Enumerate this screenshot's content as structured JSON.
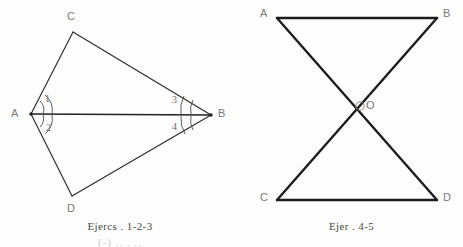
{
  "page": {
    "background_color": "#fdfdfc",
    "width": 463,
    "height": 247
  },
  "figures": [
    {
      "id": "figure-left",
      "name": "quadrilateral-with-diagonal",
      "caption": "Ejercs . 1-2-3",
      "stroke_color": "#2b2b2b",
      "label_color": "#7a7a78",
      "vertices": [
        {
          "label": "A",
          "x": 31,
          "y": 114
        },
        {
          "label": "B",
          "x": 211,
          "y": 115
        },
        {
          "label": "C",
          "x": 73,
          "y": 32
        },
        {
          "label": "D",
          "x": 72,
          "y": 196
        }
      ],
      "vertex_labels": [
        {
          "label": "A",
          "x": 11,
          "y": 108
        },
        {
          "label": "B",
          "x": 218,
          "y": 108
        },
        {
          "label": "C",
          "x": 67,
          "y": 11
        },
        {
          "label": "D",
          "x": 67,
          "y": 203
        }
      ],
      "edges": [
        {
          "from": "A",
          "to": "C"
        },
        {
          "from": "C",
          "to": "B"
        },
        {
          "from": "B",
          "to": "D"
        },
        {
          "from": "D",
          "to": "A"
        },
        {
          "from": "A",
          "to": "B",
          "role": "diagonal"
        }
      ],
      "angles": [
        {
          "number": "1",
          "at": "A",
          "label_x": 45,
          "label_y": 94
        },
        {
          "number": "2",
          "at": "A",
          "label_x": 46,
          "label_y": 123
        },
        {
          "number": "3",
          "at": "B",
          "label_x": 172,
          "label_y": 95
        },
        {
          "number": "4",
          "at": "B",
          "label_x": 172,
          "label_y": 122
        }
      ]
    },
    {
      "id": "figure-right",
      "name": "bowtie-intersecting-triangles",
      "caption": "Ejer . 4-5",
      "stroke_color": "#1c1c1c",
      "label_color": "#7a7a78",
      "vertices": [
        {
          "label": "A",
          "x": 37,
          "y": 18
        },
        {
          "label": "B",
          "x": 197,
          "y": 18
        },
        {
          "label": "C",
          "x": 37,
          "y": 200
        },
        {
          "label": "D",
          "x": 197,
          "y": 200
        },
        {
          "label": "O",
          "x": 117,
          "y": 108
        }
      ],
      "vertex_labels": [
        {
          "label": "A",
          "x": 20,
          "y": 8
        },
        {
          "label": "B",
          "x": 203,
          "y": 8
        },
        {
          "label": "C",
          "x": 20,
          "y": 192
        },
        {
          "label": "D",
          "x": 203,
          "y": 192
        },
        {
          "label": "O",
          "x": 124,
          "y": 101
        }
      ],
      "edges": [
        {
          "from": "A",
          "to": "B",
          "role": "top"
        },
        {
          "from": "C",
          "to": "D",
          "role": "bottom"
        },
        {
          "from": "A",
          "to": "D",
          "role": "diagonal"
        },
        {
          "from": "B",
          "to": "C",
          "role": "diagonal"
        }
      ],
      "intersection_marker": {
        "label": "O",
        "x": 117,
        "y": 108,
        "r": 4
      }
    }
  ],
  "faint_bottom_text": "(-) ..  . .."
}
